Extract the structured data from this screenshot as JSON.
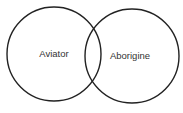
{
  "diagram": {
    "type": "venn",
    "sets": [
      {
        "label": "Aviator",
        "cx": 54,
        "cy": 54,
        "r": 47
      },
      {
        "label": "Aborigine",
        "cx": 132,
        "cy": 56,
        "r": 47
      }
    ],
    "stroke_color": "#222222",
    "label_color": "#333333",
    "background": "#ffffff"
  }
}
